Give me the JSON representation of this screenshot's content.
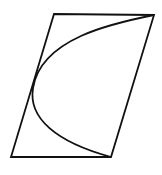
{
  "diagram": {
    "stroke_color": "#111111",
    "background": "#ffffff",
    "parallelogram": {
      "vertices": [
        [
          54,
          14
        ],
        [
          154,
          15
        ],
        [
          111,
          157
        ],
        [
          11,
          157
        ]
      ]
    },
    "curve": {
      "type": "parabola",
      "start": [
        154,
        15
      ],
      "vertex": [
        33,
        88
      ],
      "end": [
        111,
        157
      ]
    }
  }
}
